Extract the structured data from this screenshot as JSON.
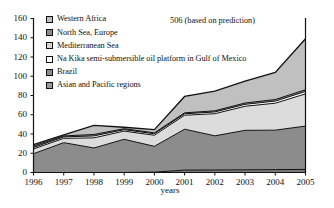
{
  "chart_data": {
    "type": "area",
    "title": "",
    "subtitle": "",
    "xlabel": "years",
    "ylabel": "",
    "categories": [
      "1996",
      "1997",
      "1998",
      "1999",
      "2000",
      "2001",
      "2002",
      "2003",
      "2004",
      "2005"
    ],
    "x": [
      1996,
      1997,
      1998,
      1999,
      2000,
      2001,
      2002,
      2003,
      2004,
      2005
    ],
    "xlim": [
      1996,
      2005
    ],
    "ylim": [
      0,
      160
    ],
    "yticks": [
      0,
      20,
      40,
      60,
      80,
      100,
      120,
      140,
      160
    ],
    "grid": false,
    "stacked": true,
    "legend_position": "top-left",
    "annotations": [
      {
        "text": "506 (based on prediction)",
        "x": 2000.6,
        "y": 152
      }
    ],
    "series": [
      {
        "name": "Asian and Pacific regions",
        "color": "#7a7a7a",
        "values": [
          0,
          0,
          0,
          0,
          0.4,
          2.5,
          2.6,
          2.8,
          3.0,
          3.2
        ]
      },
      {
        "name": "Brazil",
        "color": "#8c8c8c",
        "values": [
          19.5,
          31.0,
          25.5,
          34.5,
          26.8,
          42.5,
          35.5,
          41.0,
          41.0,
          45.0
        ]
      },
      {
        "name": "Na Kika semi-submersible oil platform in Gulf of Mexico",
        "color": "#dcdcdc",
        "values": [
          5.0,
          4.5,
          10.5,
          8.5,
          11.5,
          14.5,
          23.0,
          25.0,
          28.0,
          33.5
        ]
      },
      {
        "name": "Mediterranean Sea",
        "color": "#ffffff",
        "values": [
          1.5,
          1.5,
          2.0,
          1.5,
          1.5,
          1.5,
          1.8,
          2.0,
          2.2,
          2.5
        ]
      },
      {
        "name": "North Sea, Europe",
        "color": "#8c8c8c",
        "values": [
          1.5,
          1.0,
          1.5,
          1.0,
          1.0,
          1.0,
          1.2,
          1.4,
          1.6,
          1.8
        ]
      },
      {
        "name": "Western Africa",
        "color": "#c0c0c0",
        "values": [
          1.5,
          1.0,
          9.5,
          1.5,
          3.3,
          17.0,
          20.4,
          22.8,
          28.2,
          53.0
        ]
      }
    ],
    "stack_tops": {
      "Asian and Pacific regions": [
        0,
        0,
        0,
        0,
        0.4,
        2.5,
        2.6,
        2.8,
        3.0,
        3.2
      ],
      "Brazil": [
        19.5,
        31.0,
        25.5,
        34.5,
        27.2,
        45.0,
        38.1,
        43.8,
        44.0,
        48.2
      ],
      "Na Kika semi-submersible oil platform in Gulf of Mexico": [
        24.5,
        35.5,
        36.0,
        43.0,
        38.7,
        59.5,
        61.1,
        68.8,
        72.0,
        81.7
      ],
      "Mediterranean Sea": [
        26.0,
        37.0,
        38.0,
        44.5,
        40.2,
        61.0,
        62.9,
        70.8,
        74.2,
        84.2
      ],
      "North Sea, Europe": [
        27.5,
        38.0,
        39.5,
        45.5,
        41.2,
        62.0,
        64.1,
        72.2,
        75.8,
        86.0
      ],
      "Western Africa": [
        29.0,
        39.0,
        49.0,
        47.0,
        44.5,
        79.0,
        84.5,
        95.0,
        104.0,
        139.0
      ]
    }
  },
  "legend": {
    "items": [
      {
        "label": "Western Africa",
        "color": "#c0c0c0"
      },
      {
        "label": "North Sea, Europe",
        "color": "#8c8c8c"
      },
      {
        "label": "Mediterranean Sea",
        "color": "#d4d4d4"
      },
      {
        "label": "Na Kika semi-submersible oil platform in Gulf of Mexico",
        "color": "#ffffff"
      },
      {
        "label": "Brazil",
        "color": "#8c8c8c"
      },
      {
        "label": "Asian and Pacific regions",
        "color": "#9a9a9a"
      }
    ]
  },
  "axes": {
    "y_tick_labels": [
      "160",
      "140",
      "120",
      "100",
      "80",
      "60",
      "40",
      "20",
      "0"
    ],
    "x_tick_labels": [
      "1996",
      "1997",
      "1998",
      "1999",
      "2000",
      "2001",
      "2002",
      "2003",
      "2004",
      "2005"
    ],
    "x_axis_title": "years"
  }
}
